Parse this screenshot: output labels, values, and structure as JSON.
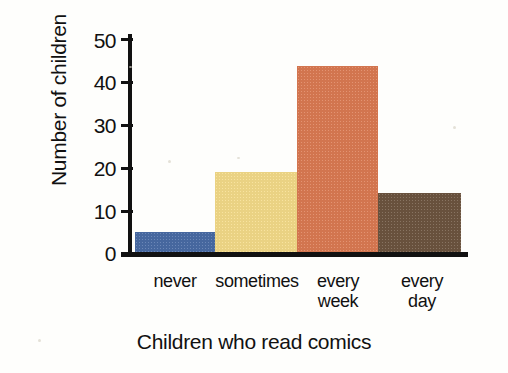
{
  "chart_data": {
    "type": "bar",
    "title": "",
    "xlabel": "Children who read comics",
    "ylabel": "Number of children",
    "categories": [
      "never",
      "sometimes",
      "every week",
      "every day"
    ],
    "category_lines": [
      [
        "never"
      ],
      [
        "sometimes"
      ],
      [
        "every",
        "week"
      ],
      [
        "every",
        "day"
      ]
    ],
    "values": [
      5,
      19,
      44,
      14
    ],
    "bar_colors": [
      "#4a6da7",
      "#f7dd8a",
      "#dd7b53",
      "#6e5540"
    ],
    "ylim": [
      0,
      50
    ],
    "yticks": [
      0,
      10,
      20,
      30,
      40,
      50
    ],
    "ytick_labels": [
      "0",
      "10",
      "20",
      "30",
      "40",
      "50"
    ],
    "grid": false,
    "legend": "none"
  },
  "axes": {
    "axis_color": "#111111",
    "background": "#fefefc"
  }
}
